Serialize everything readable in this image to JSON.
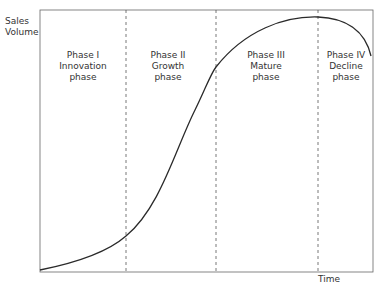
{
  "diagram": {
    "y_axis_label_line1": "Sales",
    "y_axis_label_line2": "Volume",
    "x_axis_label": "Time",
    "phases": [
      {
        "line1": "Phase I",
        "line2": "Innovation",
        "line3": "phase"
      },
      {
        "line1": "Phase II",
        "line2": "Growth",
        "line3": "phase"
      },
      {
        "line1": "Phase III",
        "line2": "Mature",
        "line3": "phase"
      },
      {
        "line1": "Phase IV",
        "line2": "Decline",
        "line3": "phase"
      }
    ],
    "colors": {
      "line": "#2a2a2a",
      "frame": "#555555",
      "divider": "#555555",
      "background": "#ffffff"
    }
  }
}
